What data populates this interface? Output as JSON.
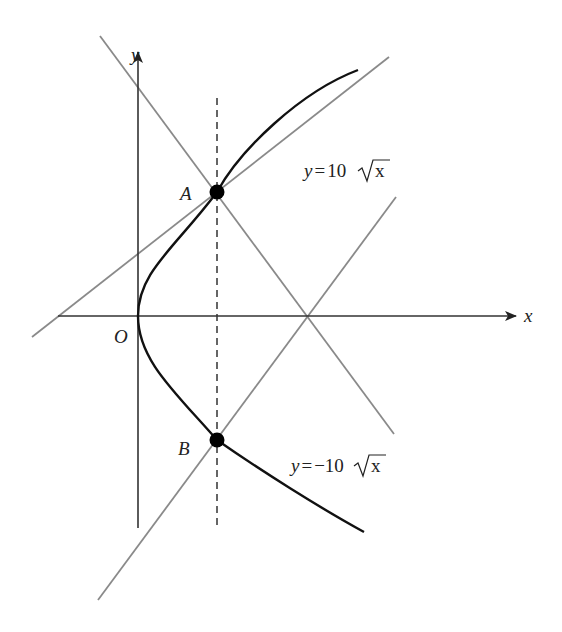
{
  "figure": {
    "colors": {
      "curve": "#111111",
      "axis": "#333333",
      "line": "#8a8a8a",
      "dashed": "#333333",
      "point": "#000000",
      "background": "#ffffff"
    },
    "axes": {
      "x_label": "x",
      "y_label": "y",
      "origin_label": "O"
    },
    "points": [
      {
        "label": "A",
        "px": 217,
        "py": 192
      },
      {
        "label": "B",
        "px": 217,
        "py": 440
      }
    ],
    "curves": [
      {
        "name": "upper-branch",
        "equation_prefix": "y = 10",
        "equation_radicand": "x"
      },
      {
        "name": "lower-branch",
        "equation_prefix": "y = −10",
        "equation_radicand": "x"
      }
    ],
    "lines": [
      {
        "name": "tangent-at-A",
        "x1": 32,
        "y1": 337,
        "x2": 389,
        "y2": 57
      },
      {
        "name": "normal-at-A",
        "x1": 100,
        "y1": 36,
        "x2": 394,
        "y2": 434
      },
      {
        "name": "normal-at-B",
        "x1": 98,
        "y1": 600,
        "x2": 396,
        "y2": 197
      }
    ]
  }
}
